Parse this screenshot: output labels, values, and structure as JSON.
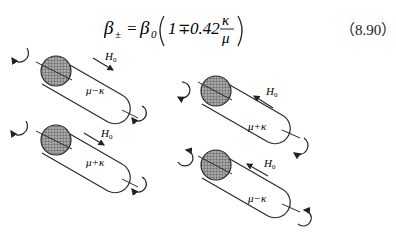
{
  "equation": {
    "lhs": "β±",
    "lhs_symbol": "β",
    "lhs_sub": "±",
    "rhs_prefix": "β",
    "rhs_sub": "0",
    "paren_open": "(",
    "one": "1",
    "op": "∓",
    "coefficient": "0.42",
    "numerator": "κ",
    "denominator": "μ",
    "paren_close": ")",
    "equals": "=",
    "number": "（8.90）"
  },
  "figure": {
    "cylinders": [
      {
        "id": "top-left",
        "label": "μ−κ",
        "field_label": "H",
        "field_sub": "0",
        "field_direction": "down-right"
      },
      {
        "id": "bottom-left",
        "label": "μ+κ",
        "field_label": "H",
        "field_sub": "0",
        "field_direction": "down-right"
      },
      {
        "id": "top-right",
        "label": "μ+κ",
        "field_label": "H",
        "field_sub": "0",
        "field_direction": "up-left"
      },
      {
        "id": "bottom-right",
        "label": "μ−κ",
        "field_label": "H",
        "field_sub": "0",
        "field_direction": "up-left"
      }
    ],
    "colors": {
      "line": "#2a2a2a",
      "cap_fill": "#8c8c8c"
    }
  }
}
